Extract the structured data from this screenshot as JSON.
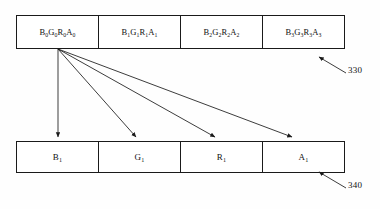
{
  "figure": {
    "background_color": "#fefefe",
    "line_color": "#1a1a1a",
    "text_color": "#111111"
  },
  "top_table": {
    "reference_numeral": "330",
    "cells": [
      {
        "base": "B",
        "sub": "0",
        "parts": [
          [
            "B",
            "0"
          ],
          [
            "G",
            "0"
          ],
          [
            "R",
            "0"
          ],
          [
            "A",
            "0"
          ]
        ]
      },
      {
        "parts": [
          [
            "B",
            "1"
          ],
          [
            "G",
            "1"
          ],
          [
            "R",
            "1"
          ],
          [
            "A",
            "1"
          ]
        ]
      },
      {
        "parts": [
          [
            "B",
            "2"
          ],
          [
            "G",
            "2"
          ],
          [
            "R",
            "2"
          ],
          [
            "A",
            "2"
          ]
        ]
      },
      {
        "parts": [
          [
            "B",
            "3"
          ],
          [
            "G",
            "3"
          ],
          [
            "R",
            "3"
          ],
          [
            "A",
            "3"
          ]
        ]
      }
    ],
    "labels": [
      "B0G0R0A0",
      "B1G1R1A1",
      "B2G2R2A2",
      "B3G3R3A3"
    ]
  },
  "bottom_table": {
    "reference_numeral": "340",
    "cells": [
      {
        "base": "B",
        "sub": "1"
      },
      {
        "base": "G",
        "sub": "1"
      },
      {
        "base": "R",
        "sub": "1"
      },
      {
        "base": "A",
        "sub": "1"
      }
    ],
    "labels": [
      "B1",
      "G1",
      "R1",
      "A1"
    ]
  },
  "arrows": {
    "origin": {
      "x": 58,
      "y": 49
    },
    "targets": [
      {
        "x": 58,
        "y": 138,
        "to": "B1"
      },
      {
        "x": 137,
        "y": 138,
        "to": "G1"
      },
      {
        "x": 216,
        "y": 138,
        "to": "R1"
      },
      {
        "x": 293,
        "y": 138,
        "to": "A1"
      }
    ]
  },
  "leaders": [
    {
      "numeral": "330",
      "tail": {
        "x": 344,
        "y": 73
      },
      "head": {
        "x": 318,
        "y": 57
      }
    },
    {
      "numeral": "340",
      "tail": {
        "x": 344,
        "y": 188
      },
      "head": {
        "x": 318,
        "y": 172
      }
    }
  ]
}
